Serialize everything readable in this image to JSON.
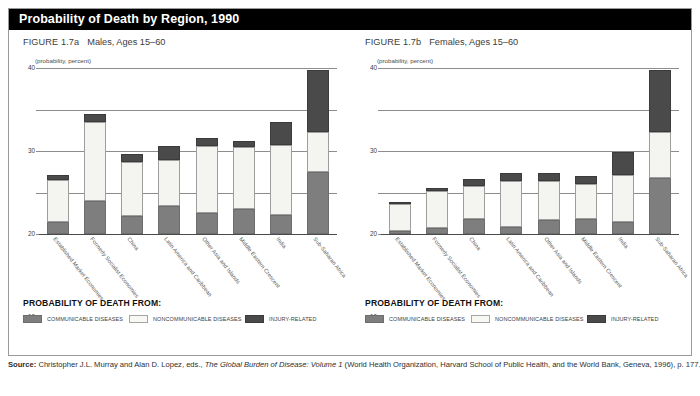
{
  "figure": {
    "title": "Probability of Death by Region, 1990",
    "source": {
      "label": "Source:",
      "text_before": "Christopher J.L. Murray and Alan D. Lopez, eds.,",
      "italic_title": "The Global Burden of Disease: Volume 1",
      "text_after": "(World Health Organization, Harvard School of Public Health, and the World Bank, Geneva, 1996), p. 177."
    }
  },
  "legend": {
    "title": "PROBABILITY OF DEATH FROM:",
    "items": [
      {
        "label": "COMMUNICABLE DISEASES",
        "color": "#7e7e7e",
        "key": "communicable"
      },
      {
        "label": "NONCOMMUNICABLE DISEASES",
        "color": "#f7f7f4",
        "key": "noncommunicable"
      },
      {
        "label": "INJURY-RELATED",
        "color": "#4a4a4a",
        "key": "injury"
      }
    ]
  },
  "panels": [
    {
      "figure_number": "FIGURE 1.7a",
      "figure_title": "Males, Ages 15–60",
      "axis_unit": "(probability, percent)"
    },
    {
      "figure_number": "FIGURE 1.7b",
      "figure_title": "Females, Ages 15–60",
      "axis_unit": "(probability, percent)"
    }
  ],
  "chart_data": [
    {
      "type": "bar",
      "stacked": true,
      "title": "FIGURE 1.7a  Males, Ages 15–60",
      "xlabel": "",
      "ylabel": "(probability, percent)",
      "ylim": [
        0,
        40
      ],
      "yticks": [
        0,
        10,
        20,
        30,
        40
      ],
      "grid": true,
      "legend_position": "below",
      "categories": [
        "Established Market Economies",
        "Formerly Socialist Economies",
        "China",
        "Latin America and Caribbean",
        "Other Asia and Islands",
        "Middle Eastern Crescent",
        "India",
        "Sub-Saharan Africa"
      ],
      "series": [
        {
          "name": "COMMUNICABLE DISEASES",
          "color": "#7e7e7e",
          "values": [
            3.0,
            8.0,
            4.3,
            6.8,
            5.0,
            6.0,
            4.5,
            15.0
          ]
        },
        {
          "name": "NONCOMMUNICABLE DISEASES",
          "color": "#f4f4f0",
          "values": [
            10.0,
            19.0,
            13.0,
            11.0,
            16.2,
            15.0,
            17.0,
            9.5
          ]
        },
        {
          "name": "INJURY-RELATED",
          "color": "#4a4a4a",
          "values": [
            1.3,
            1.8,
            2.0,
            3.3,
            2.0,
            1.5,
            5.5,
            15.0
          ]
        }
      ],
      "totals": [
        14.3,
        28.8,
        19.3,
        21.1,
        23.2,
        22.5,
        27.0,
        39.5
      ]
    },
    {
      "type": "bar",
      "stacked": true,
      "title": "FIGURE 1.7b  Females, Ages 15–60",
      "xlabel": "",
      "ylabel": "(probability, percent)",
      "ylim": [
        0,
        40
      ],
      "yticks": [
        0,
        10,
        20,
        30,
        40
      ],
      "grid": true,
      "legend_position": "below",
      "categories": [
        "Established Market Economies",
        "Formerly Socialist Economies",
        "China",
        "Latin America and Caribbean",
        "Other Asia and Islands",
        "Middle Eastern Crescent",
        "India",
        "Sub-Saharan Africa"
      ],
      "series": [
        {
          "name": "COMMUNICABLE DISEASES",
          "color": "#7e7e7e",
          "values": [
            0.8,
            1.5,
            3.5,
            1.7,
            3.3,
            3.5,
            2.8,
            13.5
          ]
        },
        {
          "name": "NONCOMMUNICABLE DISEASES",
          "color": "#f4f4f0",
          "values": [
            6.5,
            8.8,
            8.0,
            11.0,
            9.5,
            8.5,
            11.5,
            11.0
          ]
        },
        {
          "name": "INJURY-RELATED",
          "color": "#4a4a4a",
          "values": [
            0.5,
            0.8,
            1.8,
            2.0,
            1.8,
            2.0,
            5.5,
            15.0
          ]
        }
      ],
      "totals": [
        7.8,
        11.1,
        13.3,
        14.7,
        14.6,
        14.0,
        19.8,
        39.5
      ]
    }
  ]
}
